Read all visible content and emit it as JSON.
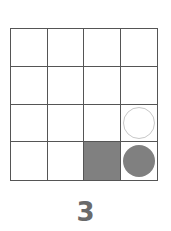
{
  "puzzle": {
    "rows": 4,
    "cols": 4,
    "cells": [
      [
        "empty",
        "empty",
        "empty",
        "empty"
      ],
      [
        "empty",
        "empty",
        "empty",
        "empty"
      ],
      [
        "empty",
        "empty",
        "empty",
        "hollow-circle"
      ],
      [
        "empty",
        "empty",
        "filled-square",
        "solid-circle"
      ]
    ],
    "colors": {
      "fill": "#808080",
      "line": "#555555",
      "hollow": "#c8c8c8",
      "label": "#6a6a6a"
    },
    "label": "3"
  }
}
